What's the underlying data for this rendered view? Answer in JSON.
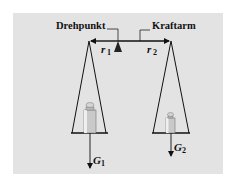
{
  "diagram": {
    "type": "lever-balance",
    "labels": {
      "pivot": "Drehpunkt",
      "lever_arm": "Kraftarm"
    },
    "arms": [
      {
        "symbol": "r",
        "subscript": "1"
      },
      {
        "symbol": "r",
        "subscript": "2"
      }
    ],
    "forces": [
      {
        "symbol": "G",
        "subscript": "1"
      },
      {
        "symbol": "G",
        "subscript": "2"
      }
    ],
    "colors": {
      "background": "#e3e3e3",
      "ink": "#111111"
    }
  }
}
